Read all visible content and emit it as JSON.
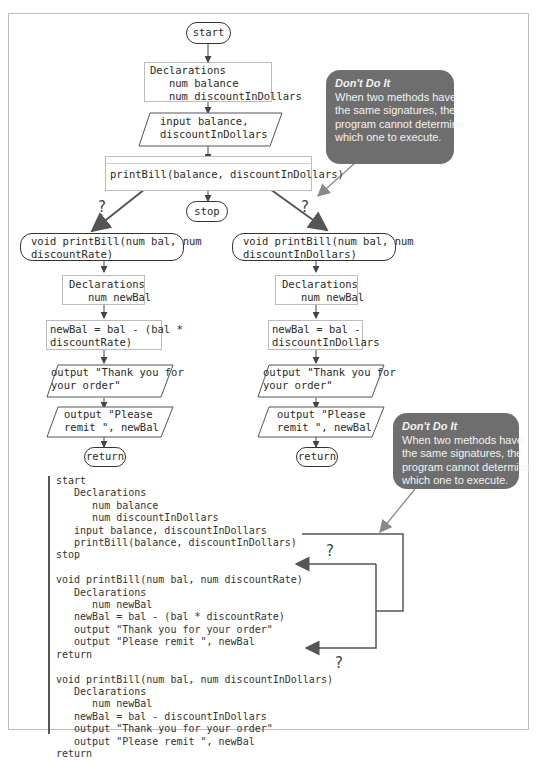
{
  "flowchart": {
    "main": {
      "start": "start",
      "declarations": "Declarations\n   num balance\n   num discountInDollars",
      "input": "input balance,\ndiscountInDollars",
      "call": "printBill(balance, discountInDollars)",
      "stop": "stop"
    },
    "left_method": {
      "header": "void printBill(num bal, num\ndiscountRate)",
      "declarations": "Declarations\n   num newBal",
      "calc": "newBal = bal - (bal *\ndiscountRate)",
      "output1": "output \"Thank you for\nyour order\"",
      "output2": "output \"Please\nremit \", newBal",
      "return": "return"
    },
    "right_method": {
      "header": "void printBill(num bal, num\ndiscountInDollars)",
      "declarations": "Declarations\n   num newBal",
      "calc": "newBal = bal -\ndiscountInDollars",
      "output1": "output \"Thank you for\nyour order\"",
      "output2": "output \"Please\nremit \", newBal",
      "return": "return"
    },
    "question_mark": "?"
  },
  "callouts": [
    {
      "title": "Don't Do It",
      "body": "When two methods have\nthe same signatures, the\nprogram cannot determine\nwhich one to execute."
    },
    {
      "title": "Don't Do It",
      "body": "When two methods have\nthe same signatures, the\nprogram cannot determine\nwhich one to execute."
    }
  ],
  "pseudocode": "start\n   Declarations\n      num balance\n      num discountInDollars\n   input balance, discountInDollars\n   printBill(balance, discountInDollars)\nstop\n\nvoid printBill(num bal, num discountRate)\n   Declarations\n      num newBal\n   newBal = bal - (bal * discountRate)\n   output \"Thank you for your order\"\n   output \"Please remit \", newBal\nreturn\n\nvoid printBill(num bal, num discountInDollars)\n   Declarations\n      num newBal\n   newBal = bal - discountInDollars\n   output \"Thank you for your order\"\n   output \"Please remit \", newBal\nreturn",
  "colors": {
    "callout_bg": "#6e6e6e",
    "arrow": "#555555",
    "callout_arrow": "#8a8a8a",
    "frame": "#bdbdbd"
  }
}
